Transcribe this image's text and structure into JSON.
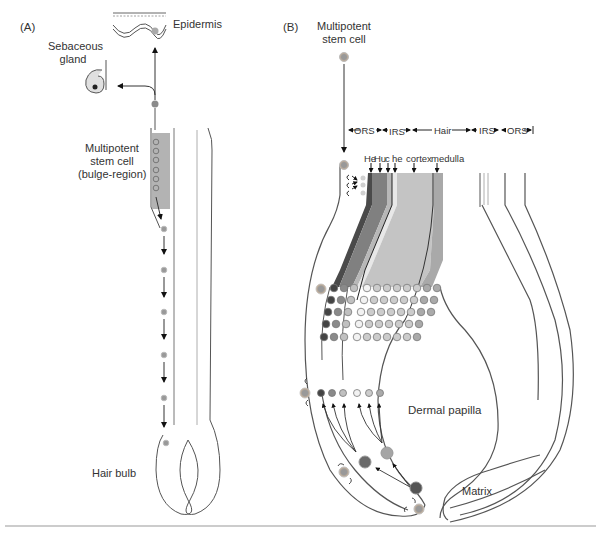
{
  "panels": {
    "a": {
      "label": "(A)",
      "epidermis": "Epidermis",
      "sebaceous_gland": [
        "Sebaceous",
        "gland"
      ],
      "stem_cell": [
        "Multipotent",
        "stem cell",
        "(bulge-region)"
      ],
      "hair_bulb": "Hair bulb"
    },
    "b": {
      "label": "(B)",
      "stem_cell": [
        "Multipotent",
        "stem cell"
      ],
      "sheath_labels": [
        "ORS",
        "IRS",
        "Hair",
        "IRS",
        "ORS"
      ],
      "layer_labels": [
        "He",
        "Hu",
        "c",
        "he",
        "cortex",
        "medulla"
      ],
      "dermal_papilla": "Dermal papilla",
      "matrix": "Matrix"
    }
  },
  "colors": {
    "line": "#555555",
    "bulge": "#b3b3b3",
    "cell_fill": "#9a9a9a",
    "cell_ring": "#c8c8c8",
    "layer_dark": "#4a4a4a",
    "layer_mid": "#808080",
    "layer_light": "#b8b8b8",
    "cortex": "#c4c4c4",
    "medulla": "#a9a9a9"
  }
}
